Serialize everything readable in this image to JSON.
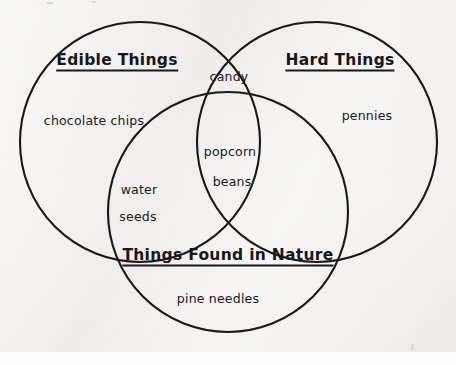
{
  "document": {
    "kind": "venn-diagram-worksheet",
    "background_color": "#f1f0ee",
    "ink_color": "#18181a"
  },
  "diagram": {
    "type": "venn-3-set",
    "sets": [
      {
        "id": "edible",
        "title": "Edible Things",
        "title_x": 117,
        "title_y": 61,
        "circle": {
          "cx": 140,
          "cy": 142,
          "r": 120
        }
      },
      {
        "id": "hard",
        "title": "Hard Things",
        "title_x": 340,
        "title_y": 61,
        "circle": {
          "cx": 317,
          "cy": 142,
          "r": 120
        }
      },
      {
        "id": "nature",
        "title": "Things Found in Nature",
        "title_x": 228,
        "title_y": 256,
        "circle": {
          "cx": 228,
          "cy": 212,
          "r": 120
        }
      }
    ],
    "items": [
      {
        "id": "chocolate-chips",
        "label": "chocolate chips",
        "region": "edible-only",
        "x": 94,
        "y": 120
      },
      {
        "id": "candy",
        "label": "candy",
        "region": "edible-hard",
        "x": 229,
        "y": 76
      },
      {
        "id": "pennies",
        "label": "pennies",
        "region": "hard-only",
        "x": 367,
        "y": 115
      },
      {
        "id": "popcorn",
        "label": "popcorn",
        "region": "edible-hard-nature",
        "x": 230,
        "y": 151
      },
      {
        "id": "beans",
        "label": "beans",
        "region": "edible-hard-nature",
        "x": 232,
        "y": 181
      },
      {
        "id": "water",
        "label": "water",
        "region": "edible-nature",
        "x": 139,
        "y": 189
      },
      {
        "id": "seeds",
        "label": "seeds",
        "region": "edible-nature",
        "x": 138,
        "y": 216
      },
      {
        "id": "pine-needles",
        "label": "pine needles",
        "region": "nature-only",
        "x": 218,
        "y": 298
      }
    ]
  }
}
